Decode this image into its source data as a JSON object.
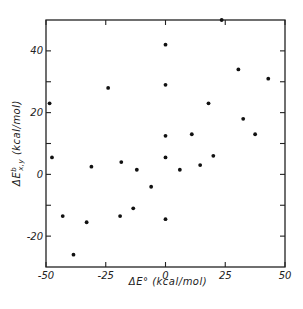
{
  "chart_data": {
    "type": "scatter",
    "title": "",
    "xlabel": "ΔE° (kcal/mol)",
    "ylabel": "ΔE^b_x,y (kcal/mol)",
    "xlim": [
      -50,
      50
    ],
    "ylim": [
      -30,
      50
    ],
    "grid": false,
    "legend": null,
    "x_ticks": [
      -50,
      -25,
      0,
      25,
      50
    ],
    "x_tick_labels": [
      "-50",
      "-25",
      "0",
      "25",
      "50"
    ],
    "y_ticks": [
      -20,
      -10,
      0,
      10,
      20,
      30,
      40
    ],
    "y_tick_labels": [
      "-20",
      "",
      "0",
      "",
      "20",
      "",
      "40"
    ],
    "series": [
      {
        "name": "data",
        "marker": "filled-circle",
        "color": "#111111",
        "points": [
          {
            "x": -48.5,
            "y": 23
          },
          {
            "x": -47.5,
            "y": 5.5
          },
          {
            "x": -24,
            "y": 28
          },
          {
            "x": -31,
            "y": 2.5
          },
          {
            "x": -43,
            "y": -13.5
          },
          {
            "x": -38.5,
            "y": -26
          },
          {
            "x": -33,
            "y": -15.5
          },
          {
            "x": -18.5,
            "y": 4
          },
          {
            "x": -19,
            "y": -13.5
          },
          {
            "x": -13.5,
            "y": -11
          },
          {
            "x": -12,
            "y": 1.5
          },
          {
            "x": -6,
            "y": -4
          },
          {
            "x": 0,
            "y": 42
          },
          {
            "x": 0,
            "y": 29
          },
          {
            "x": 0,
            "y": 12.5
          },
          {
            "x": 0,
            "y": 5.5
          },
          {
            "x": 0,
            "y": -14.5
          },
          {
            "x": 6,
            "y": 1.5
          },
          {
            "x": 11,
            "y": 13
          },
          {
            "x": 14.5,
            "y": 3
          },
          {
            "x": 18,
            "y": 23
          },
          {
            "x": 20,
            "y": 6
          },
          {
            "x": 23.5,
            "y": 50
          },
          {
            "x": 30.5,
            "y": 34
          },
          {
            "x": 32.5,
            "y": 18
          },
          {
            "x": 37.5,
            "y": 13
          },
          {
            "x": 43,
            "y": 31
          }
        ]
      }
    ]
  }
}
